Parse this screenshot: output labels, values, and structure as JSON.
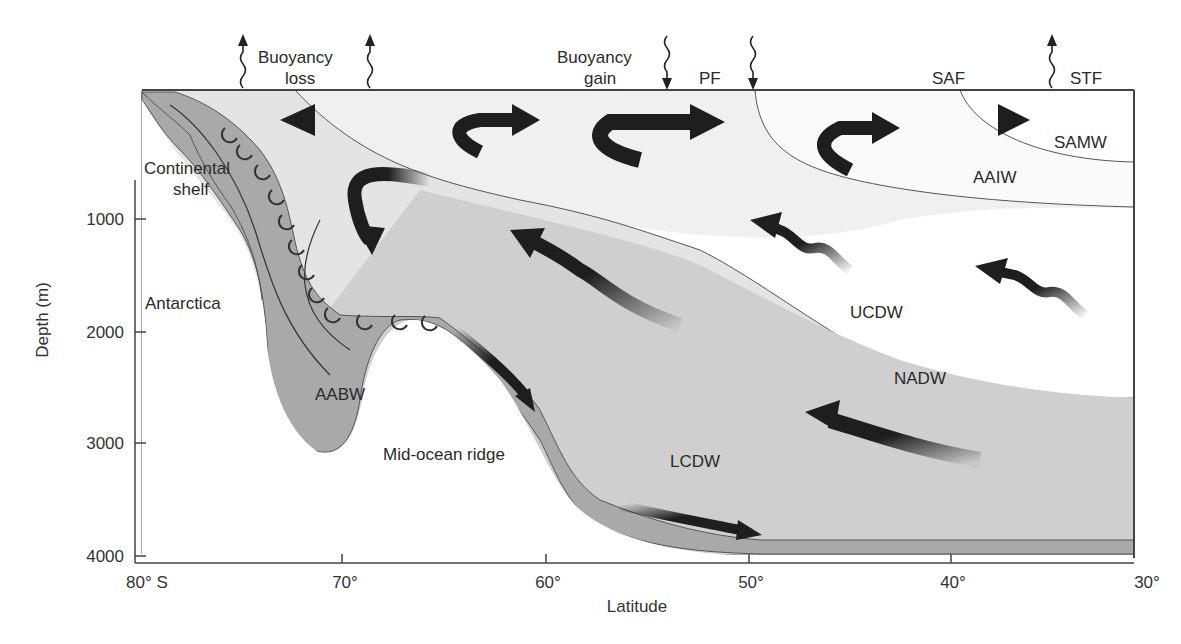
{
  "diagram": {
    "y_axis": {
      "label": "Depth (m)",
      "ticks": [
        "1000",
        "2000",
        "3000",
        "4000"
      ]
    },
    "x_axis": {
      "label": "Latitude",
      "ticks": [
        "80° S",
        "70°",
        "60°",
        "50°",
        "40°",
        "30°"
      ]
    },
    "surface_labels": {
      "buoyancy_loss_line1": "Buoyancy",
      "buoyancy_loss_line2": "loss",
      "buoyancy_gain_line1": "Buoyancy",
      "buoyancy_gain_line2": "gain",
      "pf": "PF",
      "saf": "SAF",
      "stf": "STF"
    },
    "region_labels": {
      "continental_shelf_line1": "Continental",
      "continental_shelf_line2": "shelf",
      "antarctica": "Antarctica",
      "mid_ocean_ridge": "Mid-ocean ridge"
    },
    "water_masses": {
      "samw": "SAMW",
      "aaiw": "AAIW",
      "ucdw": "UCDW",
      "nadw": "NADW",
      "lcdw": "LCDW",
      "aabw": "AABW"
    },
    "colors": {
      "deep_water": "#bdbdbd",
      "dense_water": "#a9a9a9",
      "light_water": "#e6e6e6",
      "arrow": "#1e1e1e",
      "line": "#555555"
    }
  }
}
